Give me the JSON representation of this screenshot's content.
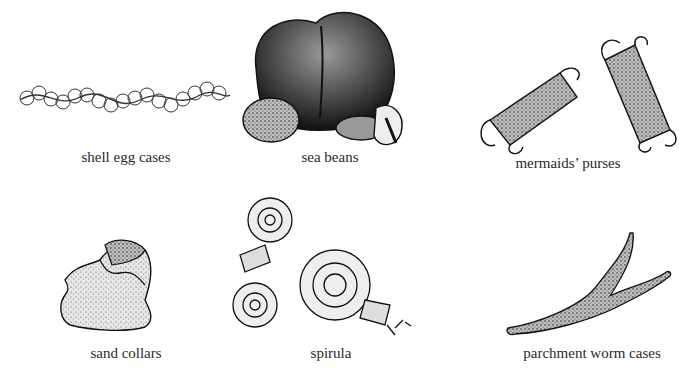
{
  "figure": {
    "items": [
      {
        "caption": "shell egg cases",
        "icon": "shell-egg-cases-illustration"
      },
      {
        "caption": "sea beans",
        "icon": "sea-beans-illustration"
      },
      {
        "caption": "mermaids’ purses",
        "icon": "mermaids-purses-illustration"
      },
      {
        "caption": "sand collars",
        "icon": "sand-collars-illustration"
      },
      {
        "caption": "spirula",
        "icon": "spirula-illustration"
      },
      {
        "caption": "parchment worm cases",
        "icon": "parchment-worm-cases-illustration"
      }
    ]
  }
}
